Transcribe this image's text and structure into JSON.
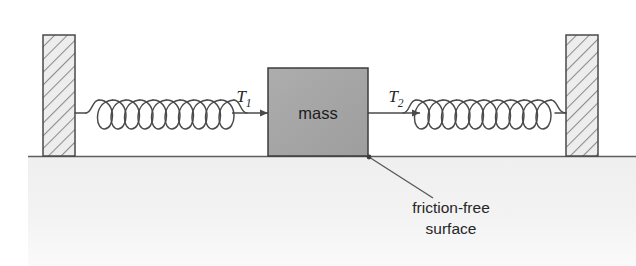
{
  "figure": {
    "width": 636,
    "height": 266,
    "background_color": "#ffffff"
  },
  "labels": {
    "mass": "mass",
    "tension_left": "T",
    "tension_left_subscript": "1",
    "tension_right": "T",
    "tension_right_subscript": "2",
    "caption_line1": "friction-free",
    "caption_line2": "surface"
  },
  "colors": {
    "mass_fill": "#a6a6a6",
    "mass_stroke": "#3d3d3d",
    "wall_fill": "#ededed",
    "wall_hatch": "#8c8c8c",
    "wall_stroke": "#4a4a4a",
    "ground_fill": "#f2f2f2",
    "ground_line": "#5e5e5e",
    "spring_stroke": "#4a4a4a",
    "arrow_stroke": "#4a4a4a",
    "leader_stroke": "#5a5a5a",
    "text": "#262626"
  },
  "geometry": {
    "left_wall": {
      "x": 43,
      "y": 35,
      "width": 32,
      "height": 121
    },
    "right_wall": {
      "x": 566,
      "y": 35,
      "width": 32,
      "height": 121
    },
    "mass_block": {
      "x": 268,
      "y": 68,
      "width": 100,
      "height": 88
    },
    "ground": {
      "x": 28,
      "y": 156,
      "width": 608,
      "height": 110
    },
    "spring_left": {
      "x1": 75,
      "x2": 232,
      "y": 113,
      "coils": 10
    },
    "spring_right": {
      "x1": 412,
      "x2": 566,
      "y": 113,
      "coils": 10
    },
    "arrow_left": {
      "from_x": 250,
      "to_x": 226,
      "y": 113,
      "direction": "left"
    },
    "arrow_right": {
      "from_x": 368,
      "to_x": 420,
      "y": 113,
      "direction": "right"
    },
    "leader_line": {
      "x1": 369,
      "y1": 157,
      "x2": 432,
      "y2": 197
    },
    "caption_anchor": {
      "x": 451,
      "y": 212
    }
  },
  "elements": {
    "left_wall_name": "Fixed wall (left support)",
    "right_wall_name": "Fixed wall (right support)",
    "ground_name": "Friction-free horizontal surface"
  }
}
